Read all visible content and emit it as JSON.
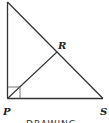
{
  "diagram": {
    "labels": {
      "P": "P",
      "R": "R",
      "S": "S"
    },
    "caption": "DRAWING",
    "colors": {
      "line": "#333333",
      "background": "#ffffff"
    }
  }
}
